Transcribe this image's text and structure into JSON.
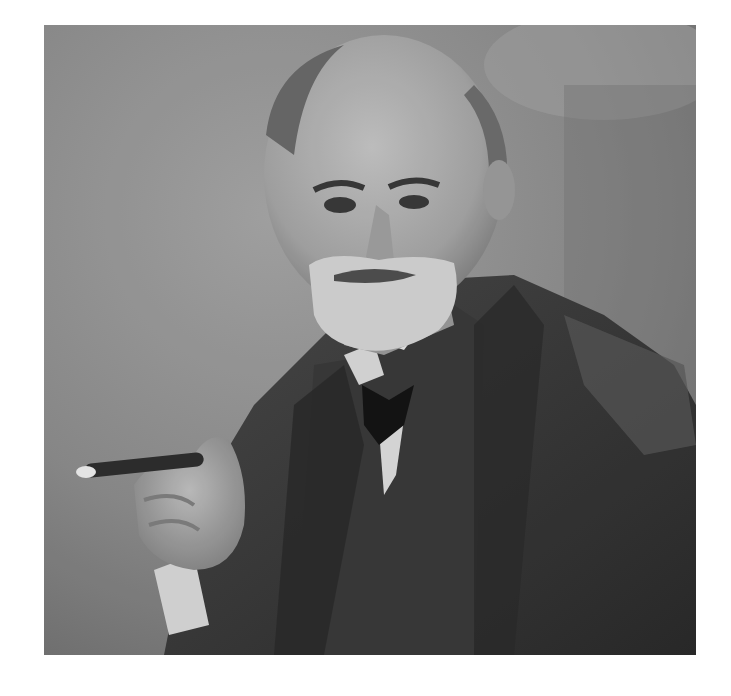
{
  "image": {
    "kind": "black-and-white portrait photograph",
    "subject": "elderly bearded man in three-piece suit holding a cigar",
    "background_color": "#ffffff",
    "photo_box": {
      "left": 44,
      "top": 25,
      "width": 652,
      "height": 630
    },
    "palette": {
      "backdrop": "#8f8f8f",
      "backdrop_dark": "#6f6f6f",
      "backdrop_light": "#a8a8a8",
      "suit": "#3c3c3c",
      "suit_dark": "#262626",
      "skin": "#b5b5b5",
      "skin_shadow": "#8a8a8a",
      "beard": "#d6d6d6",
      "collar": "#e4e4e4",
      "tie": "#151515",
      "cigar": "#2e2e2e",
      "cigar_ash": "#eeeeee"
    }
  }
}
